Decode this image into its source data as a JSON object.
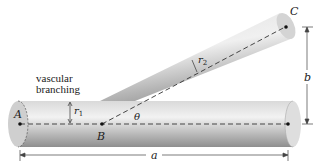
{
  "diagram": {
    "caption_line1": "vascular",
    "caption_line2": "branching",
    "points": {
      "A": "A",
      "B": "B",
      "C": "C"
    },
    "labels": {
      "r1": "r",
      "r1_sub": "1",
      "r2": "r",
      "r2_sub": "2",
      "theta": "θ",
      "a": "a",
      "b": "b"
    },
    "colors": {
      "tube_light": "#e6e6e6",
      "tube_mid": "#bdbdbd",
      "tube_dark": "#8c8c8c",
      "line": "#333333"
    }
  }
}
